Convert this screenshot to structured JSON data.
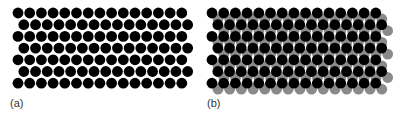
{
  "figure": {
    "panels": [
      {
        "id": "a",
        "label": "(a)",
        "label_pos": [
          10,
          98
        ],
        "layers": [
          {
            "name": "black-lattice",
            "color": "#000000",
            "origin": [
              18,
              13
            ],
            "spacing": 11.7,
            "rows": 7,
            "cols_even_row": 15,
            "cols_odd_row": 15,
            "odd_row_offset": 5.85,
            "radius": 5.4
          }
        ]
      },
      {
        "id": "b",
        "label": "(b)",
        "label_pos": [
          207,
          98
        ],
        "layers": [
          {
            "name": "gray-lattice",
            "color": "#8a8a8a",
            "origin": [
              218,
              19
            ],
            "spacing": 11.7,
            "rows": 7,
            "cols_even_row": 15,
            "cols_odd_row": 15,
            "odd_row_offset": 5.85,
            "radius": 5.4
          },
          {
            "name": "black-lattice",
            "color": "#000000",
            "origin": [
              212,
              13
            ],
            "spacing": 11.7,
            "rows": 7,
            "cols_even_row": 15,
            "cols_odd_row": 15,
            "odd_row_offset": 5.85,
            "radius": 5.4
          }
        ]
      }
    ]
  }
}
